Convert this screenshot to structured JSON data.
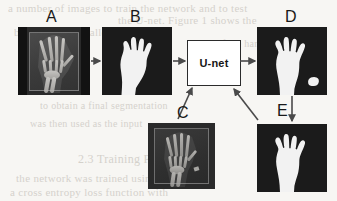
{
  "figure": {
    "kind": "pipeline-diagram",
    "background_color": "#f7f6f3",
    "ink_color": "#191919",
    "panel_bg_color": "#1b1b1b",
    "mask_color": "#f2f2f2"
  },
  "processor": {
    "label": "U-net",
    "box_fill": "#ffffff",
    "box_border": "#2b2b2b"
  },
  "panels": [
    {
      "id": "A",
      "label": "A",
      "kind": "xray",
      "description": "Original hand radiograph with film plate frame"
    },
    {
      "id": "B",
      "label": "B",
      "kind": "mask",
      "description": "Binary hand segmentation mask, hand tilted left"
    },
    {
      "id": "C",
      "label": "C",
      "kind": "xray",
      "description": "Second darker hand radiograph with marker"
    },
    {
      "id": "D",
      "label": "D",
      "kind": "mask-with-artifact",
      "description": "Predicted hand mask containing a small false-positive blob"
    },
    {
      "id": "E",
      "label": "E",
      "kind": "mask",
      "description": "Cleaned hand mask after artifact removal"
    }
  ],
  "arrows": [
    {
      "id": "a-to-b",
      "from": "A",
      "to": "B",
      "style": "straight-right"
    },
    {
      "id": "b-to-unet",
      "from": "B",
      "to": "U-net",
      "style": "straight-right"
    },
    {
      "id": "unet-to-d",
      "from": "U-net",
      "to": "D",
      "style": "straight-right"
    },
    {
      "id": "c-to-unet",
      "from": "C",
      "to": "U-net",
      "style": "diagonal-up-left"
    },
    {
      "id": "d-to-e",
      "from": "D",
      "to": "E",
      "style": "straight-down"
    },
    {
      "id": "e-to-unet",
      "from": "E",
      "to": "U-net",
      "style": "diagonal-up-left"
    }
  ],
  "background_text": {
    "visible": true,
    "note": "faint bleed-through text from the underlying scanned page",
    "lines": [
      {
        "text": "a number of images to train the network and to test",
        "x": 8,
        "y": 2,
        "size": 11
      },
      {
        "text": "the U-net. Figure 1 shows the",
        "x": 118,
        "y": 14,
        "size": 11
      },
      {
        "text": "by removing smaller regions",
        "x": 14,
        "y": 26,
        "size": 11
      },
      {
        "text": "area of the hand",
        "x": 196,
        "y": 38,
        "size": 10
      },
      {
        "text": "to obtain a final segmentation",
        "x": 40,
        "y": 100,
        "size": 10
      },
      {
        "text": "was then used as the input",
        "x": 30,
        "y": 118,
        "size": 10
      },
      {
        "text": "2.3 Training Procedure",
        "x": 78,
        "y": 152,
        "size": 12
      },
      {
        "text": "the network was trained using",
        "x": 16,
        "y": 172,
        "size": 11
      },
      {
        "text": "a cross entropy loss function with",
        "x": 10,
        "y": 186,
        "size": 11
      }
    ]
  }
}
